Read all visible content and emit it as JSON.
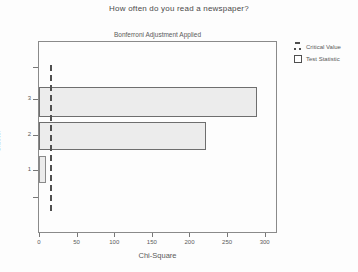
{
  "window": {
    "kind": "statistical-chart-output"
  },
  "chart_data": {
    "type": "bar",
    "orientation": "horizontal",
    "title": "How often do you read a newspaper?",
    "subtitle": "Bonferroni Adjustment Applied",
    "xlabel": "Chi-Square",
    "ylabel": "Cluster",
    "categories": [
      "3",
      "2",
      "1"
    ],
    "series": [
      {
        "name": "Test Statistic",
        "values": [
          290,
          222,
          9
        ]
      }
    ],
    "critical_value": 14,
    "xlim": [
      0,
      315
    ],
    "x_ticks": [
      0,
      50,
      100,
      150,
      200,
      250,
      300
    ],
    "grid": false,
    "legend_position": "right"
  },
  "legend": {
    "items": [
      {
        "label": "Critical Value",
        "symbol": "dashed-line"
      },
      {
        "label": "Test Statistic",
        "symbol": "open-square"
      }
    ]
  },
  "colors": {
    "background": "#fdfdfd",
    "bar_fill": "#ececec",
    "bar_border": "#6e6e6e",
    "critical_line": "#4f4f4f",
    "frame_border": "#8a8a8a",
    "text": "#5a5a5a"
  }
}
